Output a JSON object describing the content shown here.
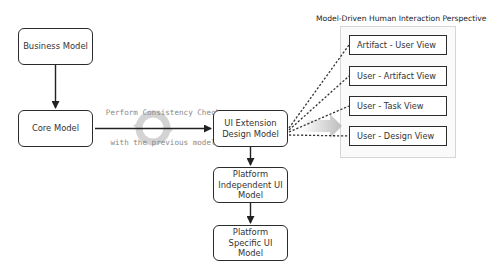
{
  "diagram": {
    "nodes": {
      "business_model": "Business Model",
      "core_model": "Core Model",
      "ui_extension": "UI Extension Design Model",
      "platform_independent": "Platform Independent UI Model",
      "platform_specific": "Platform Specific UI Model"
    },
    "consistency_label": {
      "line1": "Perform Consistency Check",
      "line2": "with the previous model"
    },
    "perspective": {
      "title": "Model-Driven Human Interaction Perspective",
      "views": [
        "Artifact - User View",
        "User - Artifact  View",
        "User - Task  View",
        "User - Design View"
      ]
    },
    "edges": [
      {
        "from": "Business Model",
        "to": "Core Model",
        "style": "solid-arrow"
      },
      {
        "from": "Core Model",
        "to": "UI Extension Design Model",
        "style": "solid-arrow"
      },
      {
        "from": "UI Extension Design Model",
        "to": "Platform Independent UI Model",
        "style": "solid-arrow"
      },
      {
        "from": "Platform Independent UI Model",
        "to": "Platform Specific UI Model",
        "style": "solid-arrow"
      },
      {
        "from": "UI Extension Design Model",
        "to": "Artifact - User View",
        "style": "dashed"
      },
      {
        "from": "UI Extension Design Model",
        "to": "User - Artifact  View",
        "style": "dashed"
      },
      {
        "from": "UI Extension Design Model",
        "to": "User - Task  View",
        "style": "dashed"
      },
      {
        "from": "UI Extension Design Model",
        "to": "User - Design View",
        "style": "dashed"
      }
    ],
    "colors": {
      "stroke": "#2b2b2b",
      "group_border": "#d6d6d6",
      "annotation_text": "#8a8a8a",
      "cycle_icon": "#c8c8c8"
    }
  }
}
